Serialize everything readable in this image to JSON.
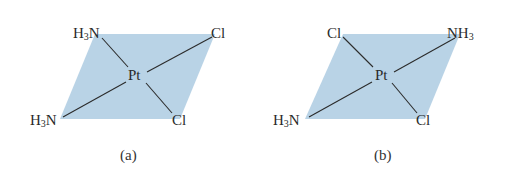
{
  "colors": {
    "plane": "#b9d3e6",
    "bond": "#2b2b2b",
    "text": "#2a2a2a"
  },
  "panels": [
    {
      "caption": "(a)",
      "center": "Pt",
      "ligands": {
        "top_left": {
          "main": "H",
          "sub": "3",
          "tail": "N"
        },
        "top_right": {
          "main": "Cl",
          "sub": "",
          "tail": ""
        },
        "bottom_left": {
          "main": "H",
          "sub": "3",
          "tail": "N"
        },
        "bottom_right": {
          "main": "Cl",
          "sub": "",
          "tail": ""
        }
      }
    },
    {
      "caption": "(b)",
      "center": "Pt",
      "ligands": {
        "top_left": {
          "main": "Cl",
          "sub": "",
          "tail": ""
        },
        "top_right": {
          "main": "NH",
          "sub": "3",
          "tail": ""
        },
        "bottom_left": {
          "main": "H",
          "sub": "3",
          "tail": "N"
        },
        "bottom_right": {
          "main": "Cl",
          "sub": "",
          "tail": ""
        }
      }
    }
  ]
}
